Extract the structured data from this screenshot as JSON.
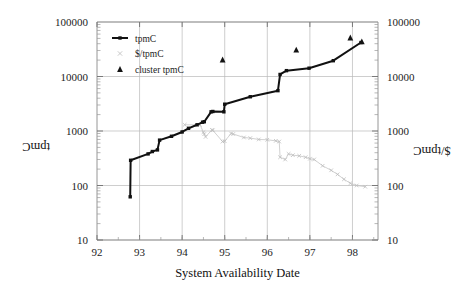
{
  "chart_data": {
    "type": "line",
    "title": "",
    "xlabel": "System Availability Date",
    "ylabel": "tpmC",
    "y2label": "$/tpmC",
    "xlim": [
      92,
      98.6
    ],
    "ylim": [
      10,
      100000
    ],
    "y2lim": [
      10,
      100000
    ],
    "yscale": "log",
    "y2scale": "log",
    "grid": true,
    "legend_position": "top-left",
    "x_ticks": [
      92,
      93,
      94,
      95,
      96,
      97,
      98
    ],
    "x_tick_labels": [
      "92",
      "93",
      "94",
      "95",
      "96",
      "97",
      "98"
    ],
    "y_ticks": [
      10,
      100,
      1000,
      10000,
      100000
    ],
    "y_tick_labels": [
      "10",
      "100",
      "1000",
      "10000",
      "100000"
    ],
    "y2_ticks": [
      10,
      100,
      1000,
      10000,
      100000
    ],
    "y2_tick_labels": [
      "10",
      "100",
      "1000",
      "10000",
      "100000"
    ],
    "legend": [
      {
        "name": "tpmC",
        "marker": "line-filled-square",
        "color": "#111111"
      },
      {
        "name": "$/tpmC",
        "marker": "x-cross",
        "color": "#c2c2c2"
      },
      {
        "name": "cluster tpmC",
        "marker": "triangle",
        "color": "#131313"
      }
    ],
    "series": [
      {
        "name": "tpmC",
        "axis": "left",
        "marker": "filled-square",
        "color": "#111111",
        "points": [
          [
            92.78,
            62
          ],
          [
            92.79,
            290
          ],
          [
            93.2,
            380
          ],
          [
            93.3,
            420
          ],
          [
            93.42,
            450
          ],
          [
            93.47,
            680
          ],
          [
            93.75,
            800
          ],
          [
            94.0,
            960
          ],
          [
            94.15,
            1120
          ],
          [
            94.35,
            1300
          ],
          [
            94.48,
            1450
          ],
          [
            94.52,
            1480
          ],
          [
            94.68,
            2250
          ],
          [
            94.72,
            2280
          ],
          [
            94.98,
            2250
          ],
          [
            95.0,
            3100
          ],
          [
            95.6,
            4250
          ],
          [
            96.25,
            5500
          ],
          [
            96.3,
            10900
          ],
          [
            96.45,
            12800
          ],
          [
            96.98,
            14200
          ],
          [
            97.55,
            19500
          ],
          [
            98.2,
            42000
          ]
        ]
      },
      {
        "name": "$/tpmC",
        "axis": "right",
        "marker": "x-cross",
        "color": "#c2c2c2",
        "points": [
          [
            94.06,
            1300
          ],
          [
            94.42,
            1300
          ],
          [
            94.5,
            950
          ],
          [
            94.52,
            880
          ],
          [
            94.55,
            780
          ],
          [
            94.7,
            1050
          ],
          [
            94.72,
            1030
          ],
          [
            94.95,
            640
          ],
          [
            95.0,
            650
          ],
          [
            95.15,
            900
          ],
          [
            95.2,
            880
          ],
          [
            95.45,
            760
          ],
          [
            95.6,
            740
          ],
          [
            95.8,
            700
          ],
          [
            96.0,
            690
          ],
          [
            96.2,
            660
          ],
          [
            96.28,
            640
          ],
          [
            96.3,
            330
          ],
          [
            96.42,
            300
          ],
          [
            96.5,
            380
          ],
          [
            96.6,
            360
          ],
          [
            96.75,
            350
          ],
          [
            96.9,
            330
          ],
          [
            97.0,
            310
          ],
          [
            97.1,
            300
          ],
          [
            97.3,
            230
          ],
          [
            97.5,
            190
          ],
          [
            97.65,
            160
          ],
          [
            97.8,
            130
          ],
          [
            97.95,
            110
          ],
          [
            98.1,
            100
          ],
          [
            98.3,
            95
          ]
        ]
      },
      {
        "name": "cluster tpmC",
        "axis": "left",
        "marker": "triangle",
        "color": "#131313",
        "points": [
          [
            94.95,
            20500
          ],
          [
            96.68,
            31000
          ],
          [
            97.95,
            52000
          ],
          [
            98.22,
            44000
          ]
        ]
      }
    ]
  },
  "axes": {
    "x_title": "System Availability Date",
    "y_left_title": "tpmC",
    "y_right_title": "$/tpmC"
  },
  "legend": {
    "entry_tpmc": "tpmC",
    "entry_dollar_tpmc": "$/tpmC",
    "entry_cluster_tpmc": "cluster tpmC"
  },
  "ticks": {
    "x": [
      "92",
      "93",
      "94",
      "95",
      "96",
      "97",
      "98"
    ],
    "y_left": [
      "100000",
      "10000",
      "1000",
      "100",
      "10"
    ],
    "y_right": [
      "100000",
      "10000",
      "1000",
      "100",
      "10"
    ]
  }
}
